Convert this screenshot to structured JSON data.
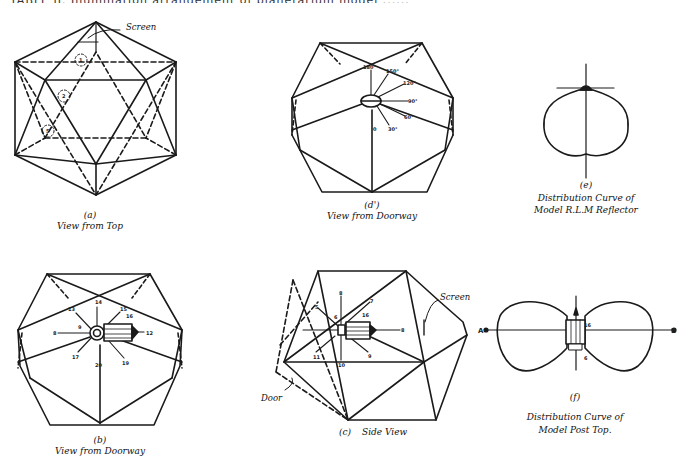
{
  "figure": {
    "top_cut_text": "TABLE II. Illumination arrangement of planetarium model ......",
    "panels": [
      {
        "id": "a",
        "letter": "(a)",
        "caption": "View from Top",
        "labels": {
          "screen": "Screen",
          "markers": [
            "1",
            "2",
            "5"
          ]
        }
      },
      {
        "id": "d",
        "letter": "(d')",
        "caption": "View from Doorway",
        "labels": {
          "angles": [
            "180°",
            "150°",
            "120°",
            "90°",
            "60°",
            "30°",
            "0"
          ]
        }
      },
      {
        "id": "e",
        "letter": "(e)",
        "caption_lines": [
          "Distribution Curve of",
          "Model R.L.M Reflector"
        ]
      },
      {
        "id": "b",
        "letter": "(b)",
        "caption": "View from Doorway",
        "labels": {
          "numbers": [
            "14",
            "13",
            "15",
            "16",
            "12",
            "9",
            "17",
            "20",
            "19"
          ],
          "left": "8"
        }
      },
      {
        "id": "c",
        "letter": "(c)",
        "caption": "Side View",
        "labels": {
          "screen": "Screen",
          "door": "Door",
          "numbers": [
            "8",
            "5",
            "7",
            "6",
            "16",
            "8",
            "11",
            "10",
            "9"
          ]
        }
      },
      {
        "id": "f",
        "letter": "(f)",
        "caption_lines": [
          "Distribution Curve of",
          "Model Post Top."
        ],
        "labels": {
          "axis_left": "A",
          "axis_right": "B",
          "markers": [
            "16",
            "6"
          ]
        }
      }
    ]
  }
}
